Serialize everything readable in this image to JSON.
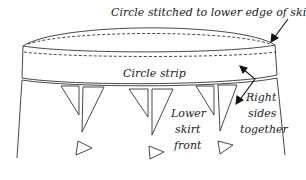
{
  "labels": {
    "top": "Circle stitched to lower edge of skirt",
    "strip": "Circle strip",
    "skirt_line1": "Lower",
    "skirt_line2": "skirt",
    "skirt_line3": "front",
    "right_line1": "Right",
    "right_line2": "sides",
    "right_line3": "together"
  },
  "colors": {
    "stroke": "#333333",
    "background": "#ffffff"
  }
}
